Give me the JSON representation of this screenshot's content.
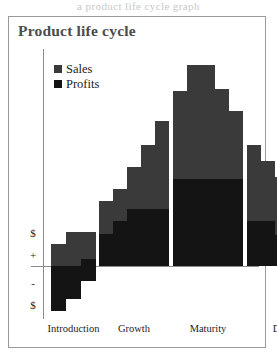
{
  "page_artifact_text": "a product life cycle graph",
  "figure": {
    "title": "Product life cycle"
  },
  "legend": {
    "items": [
      {
        "label": "Sales",
        "color": "#3a3a3a",
        "swatch_icon": "square-marker-icon"
      },
      {
        "label": "Profits",
        "color": "#141414",
        "swatch_icon": "square-marker-icon"
      }
    ]
  },
  "axes": {
    "y_labels": [
      {
        "text": "$",
        "top": 178
      },
      {
        "text": "+",
        "top": 200
      },
      {
        "text": "-",
        "top": 228
      },
      {
        "text": "$",
        "top": 250
      }
    ],
    "x_labels": [
      "Introduction",
      "Growth",
      "Maturity",
      "Decline"
    ]
  },
  "chart_data": {
    "type": "bar",
    "title": "Product life cycle",
    "xlabel": "",
    "ylabel": "$",
    "grid": false,
    "legend_position": "top-left",
    "stacked": true,
    "categories": [
      "Introduction",
      "Growth",
      "Maturity",
      "Decline"
    ],
    "series": [
      {
        "name": "Sales",
        "color": "#3a3a3a"
      },
      {
        "name": "Profits",
        "color": "#141414"
      }
    ],
    "note": "Stepped stacked bars: Sales is the upper lighter segment, Profits the lower dark segment. Profits are negative during Introduction.",
    "steps": [
      {
        "phase": "Introduction",
        "x": 8,
        "width": 15,
        "sales_top": 195,
        "profit_top": 217,
        "profit_bottom": 262
      },
      {
        "phase": "Introduction",
        "x": 23,
        "width": 15,
        "sales_top": 183,
        "profit_top": 217,
        "profit_bottom": 250
      },
      {
        "phase": "Introduction",
        "x": 38,
        "width": 15,
        "sales_top": 183,
        "profit_top": 210,
        "profit_bottom": 232
      },
      {
        "phase": "Growth",
        "x": 56,
        "width": 14,
        "sales_top": 152,
        "profit_top": 185,
        "profit_bottom": 217
      },
      {
        "phase": "Growth",
        "x": 70,
        "width": 14,
        "sales_top": 140,
        "profit_top": 172,
        "profit_bottom": 217
      },
      {
        "phase": "Growth",
        "x": 84,
        "width": 14,
        "sales_top": 118,
        "profit_top": 160,
        "profit_bottom": 217
      },
      {
        "phase": "Growth",
        "x": 98,
        "width": 14,
        "sales_top": 96,
        "profit_top": 160,
        "profit_bottom": 217
      },
      {
        "phase": "Growth",
        "x": 112,
        "width": 14,
        "sales_top": 72,
        "profit_top": 160,
        "profit_bottom": 217
      },
      {
        "phase": "Maturity",
        "x": 130,
        "width": 14,
        "sales_top": 42,
        "profit_top": 130,
        "profit_bottom": 217
      },
      {
        "phase": "Maturity",
        "x": 144,
        "width": 14,
        "sales_top": 16,
        "profit_top": 130,
        "profit_bottom": 217
      },
      {
        "phase": "Maturity",
        "x": 158,
        "width": 14,
        "sales_top": 16,
        "profit_top": 130,
        "profit_bottom": 217
      },
      {
        "phase": "Maturity",
        "x": 172,
        "width": 14,
        "sales_top": 40,
        "profit_top": 130,
        "profit_bottom": 217
      },
      {
        "phase": "Maturity",
        "x": 186,
        "width": 14,
        "sales_top": 62,
        "profit_top": 130,
        "profit_bottom": 217
      },
      {
        "phase": "Decline",
        "x": 204,
        "width": 14,
        "sales_top": 96,
        "profit_top": 172,
        "profit_bottom": 217
      },
      {
        "phase": "Decline",
        "x": 218,
        "width": 14,
        "sales_top": 112,
        "profit_top": 172,
        "profit_bottom": 217
      },
      {
        "phase": "Decline",
        "x": 232,
        "width": 14,
        "sales_top": 128,
        "profit_top": 186,
        "profit_bottom": 217
      },
      {
        "phase": "Decline",
        "x": 246,
        "width": 14,
        "sales_top": 146,
        "profit_top": 186,
        "profit_bottom": 217
      },
      {
        "phase": "Decline",
        "x": 260,
        "width": 14,
        "sales_top": 164,
        "profit_top": 186,
        "profit_bottom": 217
      },
      {
        "phase": "Decline",
        "x": 274,
        "width": 14,
        "sales_top": 182,
        "profit_top": 196,
        "profit_bottom": 217
      }
    ]
  }
}
